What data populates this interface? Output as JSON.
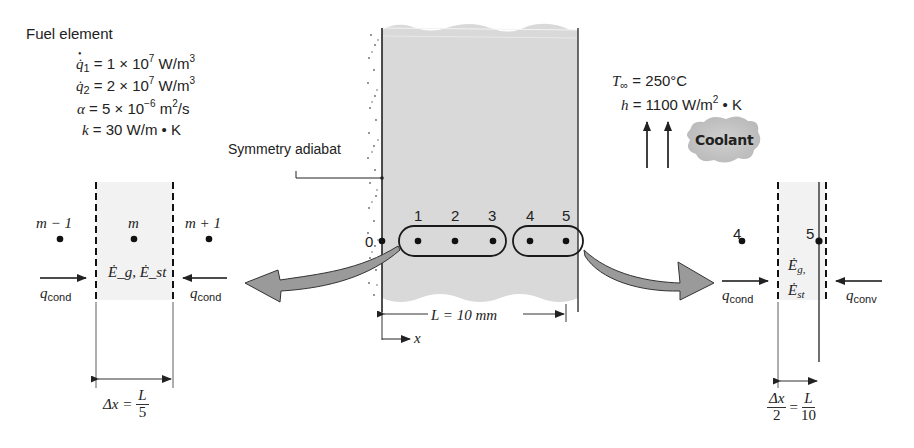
{
  "title": "Fuel element",
  "properties": [
    {
      "symbol": "q̇",
      "subscript": "1",
      "value": "= 1 × 10",
      "exp": "7",
      "unit": " W/m",
      "unit_exp": "3"
    },
    {
      "symbol": "q̇",
      "subscript": "2",
      "value": "= 2 × 10",
      "exp": "7",
      "unit": " W/m",
      "unit_exp": "3"
    },
    {
      "symbol": "α",
      "subscript": "",
      "value": "= 5 × 10",
      "exp": "−6",
      "unit": " m",
      "unit_exp": "2",
      "unit_tail": "/s"
    },
    {
      "symbol": "k",
      "subscript": "",
      "value": "= 30 W/m • K",
      "exp": "",
      "unit": "",
      "unit_exp": ""
    }
  ],
  "coolant": {
    "T_symbol": "T",
    "T_sub": "∞",
    "T_value": "= 250°C",
    "h_symbol": "h",
    "h_value": "= 1100 W/m",
    "h_exp": "2",
    "h_tail": " • K",
    "label": "Coolant"
  },
  "wall": {
    "adiabat_label": "Symmetry adiabat",
    "length_label": "L = 10 mm",
    "x_axis_label": "x",
    "node_labels": [
      "0",
      "1",
      "2",
      "3",
      "4",
      "5"
    ]
  },
  "left_detail": {
    "node_prev": "m − 1",
    "node_center": "m",
    "node_next": "m + 1",
    "energy_label": "Ė_g, Ė_st",
    "q_left": "q",
    "q_left_sub": "cond",
    "q_right": "q",
    "q_right_sub": "cond",
    "dx_label_lhs": "Δx =",
    "dx_num": "L",
    "dx_den": "5"
  },
  "right_detail": {
    "node_prev": "4",
    "node_surface": "5",
    "energy_g": "Ė",
    "energy_g_sub": "g,",
    "energy_st": "Ė",
    "energy_st_sub": "st",
    "q_left": "q",
    "q_left_sub": "cond",
    "q_right": "q",
    "q_right_sub": "conv",
    "half_dx_num": "Δx",
    "half_dx_den": "2",
    "eq": "=",
    "L_num": "L",
    "L_den": "10"
  },
  "colors": {
    "slab_fill": "#d9d9d9",
    "arrow_fill": "#9a9a9a",
    "cv_fill": "#f0f0f0",
    "line": "#222222"
  }
}
